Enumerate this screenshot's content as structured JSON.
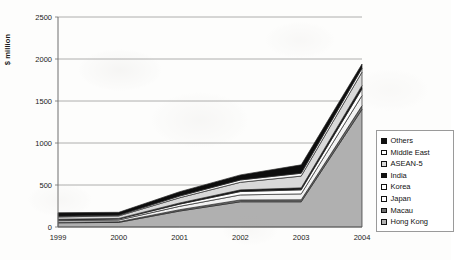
{
  "chart_data": {
    "type": "area",
    "stacked": true,
    "title": "",
    "xlabel": "",
    "ylabel": "$ million",
    "categories": [
      "1999",
      "2000",
      "2001",
      "2002",
      "2003",
      "2004"
    ],
    "x_tick_labels": [
      "1999",
      "2000",
      "2001",
      "2002",
      "2003",
      "2004"
    ],
    "y_tick_labels": [
      "0",
      "500",
      "1000",
      "1500",
      "2000",
      "2500"
    ],
    "ylim": [
      0,
      2500
    ],
    "y_tick_step": 500,
    "grid": "horizontal",
    "legend_position": "right",
    "stack_order_bottom_to_top": [
      "Hong Kong",
      "Macau",
      "Japan",
      "Korea",
      "India",
      "ASEAN-5",
      "Middle East",
      "Others"
    ],
    "series": [
      {
        "name": "Hong Kong",
        "color": "#b0b0b0",
        "values": [
          50,
          55,
          190,
          300,
          300,
          1400
        ]
      },
      {
        "name": "Macau",
        "color": "#707070",
        "values": [
          8,
          8,
          16,
          22,
          24,
          45
        ]
      },
      {
        "name": "Japan",
        "color": "#f2f2f2",
        "values": [
          18,
          20,
          40,
          60,
          70,
          120
        ]
      },
      {
        "name": "Korea",
        "color": "#ffffff",
        "values": [
          10,
          12,
          26,
          40,
          48,
          80
        ]
      },
      {
        "name": "India",
        "color": "#111111",
        "values": [
          6,
          7,
          14,
          20,
          24,
          40
        ]
      },
      {
        "name": "ASEAN-5",
        "color": "#d9d9d9",
        "values": [
          28,
          30,
          62,
          90,
          140,
          160
        ]
      },
      {
        "name": "Middle East",
        "color": "#fafafa",
        "values": [
          8,
          9,
          20,
          28,
          34,
          45
        ]
      },
      {
        "name": "Others",
        "color": "#0d0d0d",
        "values": [
          42,
          34,
          52,
          60,
          100,
          50
        ]
      }
    ],
    "totals": [
      170,
      175,
      420,
      620,
      740,
      1940
    ]
  },
  "legend": {
    "items": [
      {
        "label": "Others",
        "swatch": "black"
      },
      {
        "label": "Middle East",
        "swatch": "white"
      },
      {
        "label": "ASEAN-5",
        "swatch": "light-gray"
      },
      {
        "label": "India",
        "swatch": "black"
      },
      {
        "label": "Korea",
        "swatch": "white"
      },
      {
        "label": "Japan",
        "swatch": "white"
      },
      {
        "label": "Macau",
        "swatch": "dark-gray"
      },
      {
        "label": "Hong Kong",
        "swatch": "medium-gray"
      }
    ]
  },
  "axis": {
    "y_title": "$ million"
  },
  "colors": {
    "hong_kong": "#b0b0b0",
    "macau": "#707070",
    "japan": "#f2f2f2",
    "korea": "#ffffff",
    "india": "#111111",
    "asean5": "#d9d9d9",
    "middle_east": "#fafafa",
    "others": "#0d0d0d",
    "gridline": "#9a9a9a",
    "axis": "#6e6e6e",
    "text": "#1a1a1a"
  }
}
